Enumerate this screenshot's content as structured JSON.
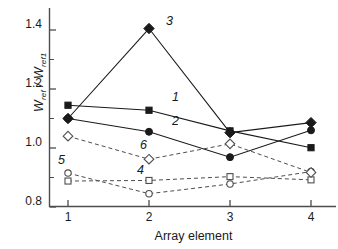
{
  "chart_data": {
    "type": "line",
    "title": "",
    "xlabel": "Array element",
    "ylabel_main": "W",
    "ylabel_sub1": "ref",
    "ylabel_mid": " / ",
    "ylabel_main2": "W",
    "ylabel_sub2": "ref1",
    "ylabel_plain": "W_ref / W_ref1",
    "x": [
      1,
      2,
      3,
      4
    ],
    "categories": [
      "1",
      "2",
      "3",
      "4"
    ],
    "xtick_labels": [
      "1",
      "2",
      "3",
      "4"
    ],
    "ytick_labels": [
      "0.8",
      "1.0",
      "1.2",
      "1.4"
    ],
    "ytick_values": [
      0.8,
      1.0,
      1.2,
      1.4
    ],
    "yminor_values": [
      0.9,
      1.1,
      1.3
    ],
    "xlim": [
      0.82,
      4.18
    ],
    "ylim": [
      0.8,
      1.45
    ],
    "grid": false,
    "legend_position": "inline-annotations",
    "series": [
      {
        "name": "1",
        "label": "1",
        "marker": "filled-square",
        "linestyle": "solid",
        "color": "#1a1a1a",
        "values": [
          1.145,
          1.128,
          1.058,
          1.001
        ]
      },
      {
        "name": "2",
        "label": "2",
        "marker": "filled-circle",
        "linestyle": "solid",
        "color": "#1a1a1a",
        "values": [
          1.1,
          1.055,
          0.969,
          1.06
        ]
      },
      {
        "name": "3",
        "label": "3",
        "marker": "filled-diamond",
        "linestyle": "solid",
        "color": "#1a1a1a",
        "values": [
          1.1,
          1.405,
          1.052,
          1.086
        ]
      },
      {
        "name": "4",
        "label": "4",
        "marker": "open-square",
        "linestyle": "dashed",
        "color": "#4d4d4d",
        "values": [
          0.888,
          0.89,
          0.903,
          0.892
        ]
      },
      {
        "name": "5",
        "label": "5",
        "marker": "open-circle",
        "linestyle": "dashed",
        "color": "#4d4d4d",
        "values": [
          0.915,
          0.845,
          0.878,
          0.92
        ]
      },
      {
        "name": "6",
        "label": "6",
        "marker": "open-diamond",
        "linestyle": "dashed",
        "color": "#4d4d4d",
        "values": [
          1.04,
          0.962,
          1.014,
          0.917
        ]
      }
    ],
    "annotations": [
      {
        "text": "1",
        "series": "1",
        "x_px": 172,
        "y_px": 97
      },
      {
        "text": "2",
        "series": "2",
        "x_px": 172,
        "y_px": 121
      },
      {
        "text": "3",
        "series": "3",
        "x_px": 166,
        "y_px": 21
      },
      {
        "text": "4",
        "series": "4",
        "x_px": 137,
        "y_px": 170
      },
      {
        "text": "5",
        "series": "5",
        "x_px": 58,
        "y_px": 160
      },
      {
        "text": "6",
        "series": "6",
        "x_px": 140,
        "y_px": 145
      }
    ]
  },
  "axes": {
    "y_label_positions": [
      {
        "label": "0.8",
        "y_px": 201
      },
      {
        "label": "1.0",
        "y_px": 142
      },
      {
        "label": "1.2",
        "y_px": 83
      },
      {
        "label": "1.4",
        "y_px": 24
      }
    ],
    "x_label_positions": [
      {
        "label": "1",
        "x_px": 68
      },
      {
        "label": "2",
        "x_px": 149
      },
      {
        "label": "3",
        "x_px": 230
      },
      {
        "label": "4",
        "x_px": 311
      }
    ]
  },
  "colors": {
    "axis": "#4d4d4d",
    "solid_series": "#1a1a1a",
    "dashed_series": "#4d4d4d",
    "text": "#1a1a1a",
    "background": "#ffffff"
  }
}
